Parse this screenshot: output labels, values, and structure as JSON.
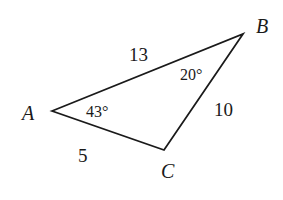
{
  "triangle": {
    "vertices": {
      "A": {
        "label": "A",
        "x": 52,
        "y": 111
      },
      "B": {
        "label": "B",
        "x": 243,
        "y": 34
      },
      "C": {
        "label": "C",
        "x": 164,
        "y": 150
      }
    },
    "sides": {
      "AB": {
        "label": "13"
      },
      "BC": {
        "label": "10"
      },
      "AC": {
        "label": "5"
      }
    },
    "angles": {
      "A": {
        "label": "43°"
      },
      "B": {
        "label": "20°"
      }
    },
    "stroke_color": "#1a1a1a"
  }
}
